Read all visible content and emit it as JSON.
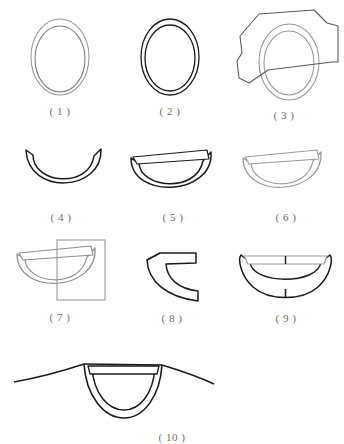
{
  "sheet": {
    "title": "Garment neckline construction steps",
    "background_color": "#ffffff",
    "stroke_dark": "#1a1a1a",
    "stroke_gray": "#9a9a9a",
    "stroke_mid": "#6e6e6e",
    "label_color": "#6e6e6e"
  },
  "figures": [
    {
      "id": "figure-1",
      "label": "( 1 )",
      "caption_text": "( 1 )",
      "description": "two concentric ovals drawn in light gray",
      "stroke": "#9a9a9a",
      "shape": "double-oval"
    },
    {
      "id": "figure-2",
      "label": "( 2 )",
      "caption_text": "( 2 )",
      "description": "two concentric ovals drawn in black",
      "stroke": "#1a1a1a",
      "shape": "double-oval"
    },
    {
      "id": "figure-3",
      "label": "( 3 )",
      "caption_text": "( 3 )",
      "description": "gray double oval overlaid by an irregular dark polygon",
      "stroke": "#9a9a9a",
      "overlay_stroke": "#5c5c5c",
      "shape": "double-oval-with-polygon"
    },
    {
      "id": "figure-4",
      "label": "( 4 )",
      "caption_text": "( 4 )",
      "description": "lower half crescent of the ring, black outline",
      "stroke": "#1a1a1a",
      "shape": "crescent-bowl"
    },
    {
      "id": "figure-5",
      "label": "( 5 )",
      "caption_text": "( 5 )",
      "description": "crescent bowl with a horizontal band across the top, black outline",
      "stroke": "#1a1a1a",
      "shape": "crescent-bowl-with-band"
    },
    {
      "id": "figure-6",
      "label": "( 6 )",
      "caption_text": "( 6 )",
      "description": "crescent bowl with band, drawn in light gray",
      "stroke": "#9a9a9a",
      "shape": "crescent-bowl-with-band"
    },
    {
      "id": "figure-7",
      "label": "( 7 )",
      "caption_text": "( 7 )",
      "description": "gray crescent bowl with band and a rectangular selection box over its right side",
      "stroke": "#9a9a9a",
      "overlay_stroke": "#8d8d8d",
      "shape": "crescent-bowl-with-band-and-rect"
    },
    {
      "id": "figure-8",
      "label": "( 8 )",
      "caption_text": "( 8 )",
      "description": "left quarter segment of the banded bowl forming a C bracket, black outline",
      "stroke": "#1a1a1a",
      "shape": "c-bracket-segment"
    },
    {
      "id": "figure-9",
      "label": "( 9 )",
      "caption_text": "( 9 )",
      "description": "symmetric bowl with flared ends, gray band across the top and center seam ticks",
      "stroke": "#1a1a1a",
      "band_stroke": "#9a9a9a",
      "shape": "flared-bowl-with-band"
    },
    {
      "id": "figure-10",
      "label": "( 10 )",
      "caption_text": "( 10 )",
      "description": "finished round neckline with collar band on shoulder seams",
      "stroke": "#1a1a1a",
      "shape": "neckline-on-shoulders"
    }
  ]
}
